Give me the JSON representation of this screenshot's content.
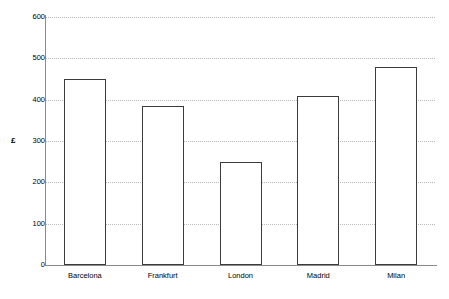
{
  "chart_data": {
    "type": "bar",
    "title": "",
    "xlabel": "",
    "ylabel": "£",
    "categories": [
      "Barcelona",
      "Frankfurt",
      "London",
      "Madrid",
      "Milan"
    ],
    "values": [
      450,
      385,
      250,
      410,
      480
    ],
    "ylim": [
      0,
      600
    ],
    "yticks": [
      0,
      100,
      200,
      300,
      400,
      500,
      600
    ],
    "ytick_labels": [
      "0",
      "100",
      "200",
      "300",
      "400",
      "500",
      "600"
    ],
    "grid": true,
    "grid_axis": "y",
    "grid_style": "dotted",
    "legend": false,
    "bar_fill": "#ffffff",
    "bar_edge": "#3b3b3b",
    "grid_color": "#b9b9b9",
    "axis_color": "#8a8a8a",
    "text_color": "#000000"
  }
}
